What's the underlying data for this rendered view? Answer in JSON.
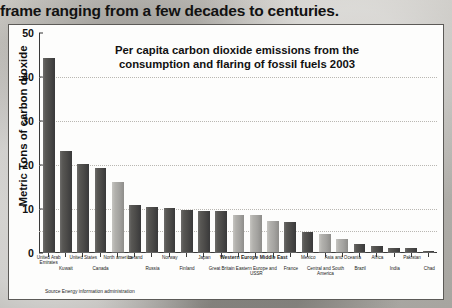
{
  "page": {
    "headline": "frame ranging from a few decades to centuries."
  },
  "chart_card": {
    "title_line1": "Per capita carbon dioxide emissions from the",
    "title_line2": "consumption and flaring of fossil fuels 2003",
    "y_axis_label": "Metric Tons of carbon dioxide",
    "source": "Source Energy information administration"
  },
  "chart_data": {
    "type": "bar",
    "title": "Per capita carbon dioxide emissions from the consumption and flaring of fossil fuels 2003",
    "xlabel": "",
    "ylabel": "Metric Tons of carbon dioxide",
    "ylim": [
      0,
      50
    ],
    "yticks": [
      0,
      10,
      20,
      30,
      40,
      50
    ],
    "grid": true,
    "legend": "none",
    "source": "Source Energy information administration",
    "categories": [
      "United Arab Emirates",
      "Kuwait",
      "United States",
      "Canada",
      "North america",
      "Iceland",
      "Russia",
      "Norway",
      "Finland",
      "Japan",
      "Great Britain",
      "Western Europe",
      "Eastern Europe and USSR",
      "Middle East",
      "France",
      "Mexico",
      "Central and South America",
      "Asia and Oceania",
      "Brazil",
      "Africa",
      "India",
      "Pakistan",
      "Chad"
    ],
    "values": [
      44,
      23,
      20,
      19,
      16,
      10.6,
      10.2,
      10.0,
      9.6,
      9.4,
      9.3,
      8.4,
      8.3,
      7.0,
      6.9,
      4.5,
      4.0,
      3.0,
      1.9,
      1.3,
      1.0,
      0.8,
      0.3
    ],
    "bar_shades": [
      "dark",
      "dark",
      "dark",
      "dark",
      "light",
      "dark",
      "dark",
      "dark",
      "dark",
      "dark",
      "dark",
      "light",
      "light",
      "light",
      "dark",
      "dark",
      "light",
      "light",
      "dark",
      "dark",
      "dark",
      "dark",
      "dark"
    ],
    "emphasized_labels": [
      "Western Europe",
      "Middle East"
    ],
    "label_rows": [
      {
        "text": "United Arab Emirates",
        "row": 0,
        "index": 0
      },
      {
        "text": "Kuwait",
        "row": 1,
        "index": 1
      },
      {
        "text": "United States",
        "row": 0,
        "index": 2
      },
      {
        "text": "Canada",
        "row": 1,
        "index": 3
      },
      {
        "text": "North america",
        "row": 0,
        "index": 4
      },
      {
        "text": "Iceland",
        "row": 0,
        "index": 5
      },
      {
        "text": "Russia",
        "row": 1,
        "index": 6
      },
      {
        "text": "Norway",
        "row": 0,
        "index": 7
      },
      {
        "text": "Finland",
        "row": 1,
        "index": 8
      },
      {
        "text": "Japan",
        "row": 0,
        "index": 9
      },
      {
        "text": "Great Britain",
        "row": 1,
        "index": 10
      },
      {
        "text": "Western Europe",
        "row": 0,
        "index": 11
      },
      {
        "text": "Eastern Europe and USSR",
        "row": 1,
        "index": 12
      },
      {
        "text": "Middle East",
        "row": 0,
        "index": 13
      },
      {
        "text": "France",
        "row": 1,
        "index": 14
      },
      {
        "text": "Mexico",
        "row": 0,
        "index": 15
      },
      {
        "text": "Central and South America",
        "row": 1,
        "index": 16
      },
      {
        "text": "Asia and Oceania",
        "row": 0,
        "index": 17
      },
      {
        "text": "Brazil",
        "row": 1,
        "index": 18
      },
      {
        "text": "Africa",
        "row": 0,
        "index": 19
      },
      {
        "text": "India",
        "row": 1,
        "index": 20
      },
      {
        "text": "Pakistan",
        "row": 0,
        "index": 21
      },
      {
        "text": "Chad",
        "row": 1,
        "index": 22
      }
    ]
  }
}
